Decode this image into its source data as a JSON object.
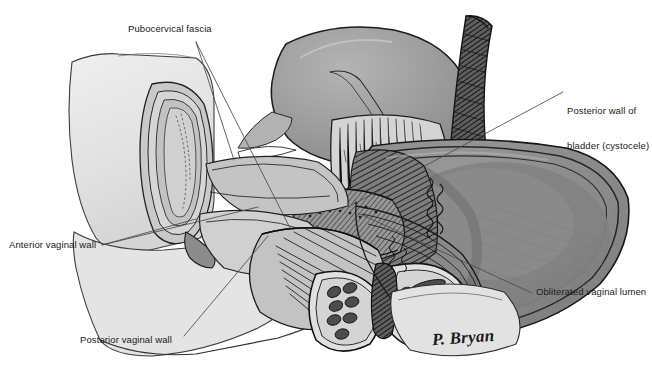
{
  "figure": {
    "type": "medical-anatomical-illustration",
    "view": "midsagittal section",
    "background_color": "#ffffff",
    "width": 652,
    "height": 391
  },
  "labels": [
    {
      "id": "pubocervical-fascia",
      "text": "Pubocervical fascia",
      "x": 128,
      "y": 28,
      "anchor": "start",
      "leaders": [
        {
          "x1": 196,
          "y1": 42,
          "x2": 290,
          "y2": 228
        },
        {
          "x1": 196,
          "y1": 42,
          "x2": 232,
          "y2": 160
        }
      ]
    },
    {
      "id": "posterior-wall-of-bladder",
      "text": "Posterior wall of\nbladder (cystocele)",
      "line1": "Posterior wall of",
      "line2": "bladder (cystocele)",
      "x": 567,
      "y": 85,
      "anchor": "start",
      "leaders": [
        {
          "x1": 563,
          "y1": 92,
          "x2": 352,
          "y2": 205
        }
      ]
    },
    {
      "id": "anterior-vaginal-wall",
      "text": "Anterior vaginal wall",
      "x": 9,
      "y": 240,
      "anchor": "start",
      "leaders": [
        {
          "x1": 102,
          "y1": 245,
          "x2": 196,
          "y2": 219
        },
        {
          "x1": 102,
          "y1": 245,
          "x2": 258,
          "y2": 207
        }
      ]
    },
    {
      "id": "posterior-vaginal-wall",
      "text": "Posterior vaginal wall",
      "x": 80,
      "y": 335,
      "anchor": "start",
      "leaders": [
        {
          "x1": 184,
          "y1": 336,
          "x2": 268,
          "y2": 236
        }
      ]
    },
    {
      "id": "obliterated-vaginal-lumen",
      "text": "Obliterated vaginal lumen",
      "x": 535,
      "y": 287,
      "anchor": "start",
      "leaders": [
        {
          "x1": 532,
          "y1": 293,
          "x2": 358,
          "y2": 213
        }
      ]
    }
  ],
  "signature": {
    "text": "P. Bryan",
    "artist": "P. Bryan"
  },
  "palette": {
    "line": "#1b1b1b",
    "leader_line": "#4a4a4a",
    "paper": "#ffffff",
    "cut_surface_light": "#e6e6e6",
    "cut_surface_mid": "#d2d2d2",
    "tissue_light": "#c6c6c6",
    "tissue_mid": "#ababab",
    "bladder_gray": "#9c9c9c",
    "prolapse_gray": "#8d8d8d",
    "prolapse_shadow": "#6f6f6f",
    "dark_tissue": "#555555",
    "muscle_dark": "#3a3a3a",
    "text": "#1a1a1a"
  },
  "structures": [
    {
      "name": "body-cut-surface",
      "tone": "#e6e6e6"
    },
    {
      "name": "uterus",
      "tone": "#c6c6c6"
    },
    {
      "name": "bladder",
      "tone": "#9c9c9c"
    },
    {
      "name": "urethra",
      "tone": "#4a4a4a"
    },
    {
      "name": "pubocervical-fascia-band",
      "tone": "#c0c0c0"
    },
    {
      "name": "prolapsed-vaginal-vault",
      "tone": "#8d8d8d"
    },
    {
      "name": "levator-ani-muscle-bundles",
      "tone": "#3f3f3f"
    },
    {
      "name": "perineal-body",
      "tone": "#bdbdbd"
    },
    {
      "name": "rectum",
      "tone": "#a5a5a5"
    }
  ]
}
